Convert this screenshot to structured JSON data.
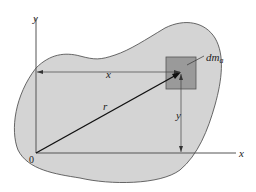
{
  "diagram": {
    "labels": {
      "y_axis": "y",
      "x_axis": "x",
      "origin": "0",
      "position_vector": "r",
      "x_distance": "x",
      "y_distance": "y",
      "mass_element": "dm",
      "mass_element_subscript": "a"
    },
    "colors": {
      "body_fill": "#d4d4d4",
      "element_fill": "#9a9a9a",
      "line": "#333333",
      "background": "#ffffff"
    }
  }
}
